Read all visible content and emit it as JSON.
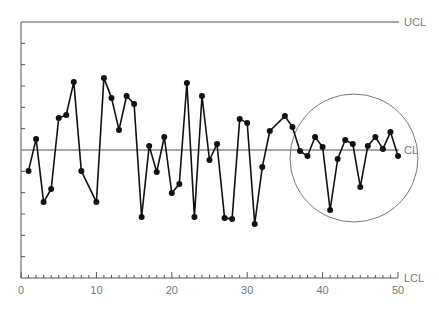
{
  "chart_data": {
    "type": "line",
    "title": "",
    "xlabel": "",
    "ylabel": "",
    "x_ticks": [
      0,
      10,
      20,
      30,
      40,
      50
    ],
    "x_tick_labels": [
      "0",
      "10",
      "20",
      "30",
      "40",
      "50"
    ],
    "xlim": [
      0,
      50
    ],
    "ylim": [
      -6,
      6
    ],
    "y_tick_step": 1,
    "y_tick_labels": [],
    "grid": false,
    "control_lines": [
      {
        "name": "UCL",
        "label": "UCL",
        "value": 6
      },
      {
        "name": "CL",
        "label": "CL",
        "value": 0
      },
      {
        "name": "LCL",
        "label": "LCL",
        "value": -6
      }
    ],
    "series": [
      {
        "name": "samples",
        "x": [
          1,
          2,
          3,
          4,
          5,
          6,
          7,
          8,
          10,
          11,
          12,
          13,
          14,
          15,
          16,
          17,
          18,
          19,
          20,
          21,
          22,
          23,
          24,
          25,
          26,
          27,
          28,
          29,
          30,
          31,
          32,
          33,
          35,
          36,
          37,
          38,
          39,
          40,
          41,
          42,
          43,
          44,
          45,
          46,
          47,
          48,
          49,
          50
        ],
        "values": [
          -0.98,
          0.52,
          -2.44,
          -1.83,
          1.5,
          1.64,
          3.19,
          -0.98,
          -2.44,
          3.38,
          2.44,
          0.94,
          2.53,
          2.16,
          -3.14,
          0.19,
          -1.03,
          0.61,
          -2.02,
          -1.59,
          3.14,
          -3.14,
          2.53,
          -0.47,
          0.28,
          -3.19,
          -3.23,
          1.45,
          1.27,
          -3.47,
          -0.8,
          0.89,
          1.59,
          1.08,
          -0.05,
          -0.28,
          0.61,
          0.14,
          -2.81,
          -0.42,
          0.47,
          0.28,
          -1.73,
          0.19,
          0.61,
          0.05,
          0.84,
          -0.28
        ]
      }
    ],
    "annotations": [
      {
        "type": "circle",
        "description": "highlighted region of reduced variation",
        "x_range": [
          36,
          52
        ],
        "center_x": 44.2,
        "center_y": -0.4
      }
    ],
    "colors": {
      "series": "#111111",
      "control_line": "#888888",
      "axis": "#555555",
      "circle": "#777777"
    }
  }
}
